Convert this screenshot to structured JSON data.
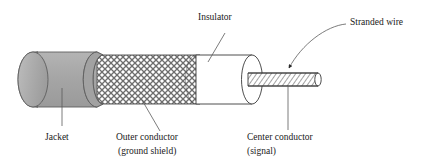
{
  "figure": {
    "background_color": "#ffffff",
    "line_color": "#3a3a3a",
    "text_color": "#1a1a1a"
  },
  "labels": {
    "insulator": "Insulator",
    "stranded_wire": "Stranded wire",
    "jacket": "Jacket",
    "outer_conductor_line1": "Outer conductor",
    "outer_conductor_line2": "(ground shield)",
    "center_conductor_line1": "Center conductor",
    "center_conductor_line2": "(signal)"
  },
  "parts": {
    "jacket": {
      "name": "Jacket",
      "fill_color": "#a8a8a8",
      "description": "outer gray sheath with rounded cut end"
    },
    "outer_conductor": {
      "name": "Outer conductor (ground shield)",
      "fill_color": "#ffffff",
      "pattern": "diamond-braid-crosshatch",
      "description": "braided mesh ground shield"
    },
    "insulator": {
      "name": "Insulator",
      "fill_color": "#ffffff",
      "description": "white dielectric cylinder"
    },
    "center_conductor": {
      "name": "Center conductor (signal)",
      "fill_color": "#ffffff",
      "pattern": "diagonal-hatch",
      "description": "thin hatched signal wire, stranded"
    }
  }
}
